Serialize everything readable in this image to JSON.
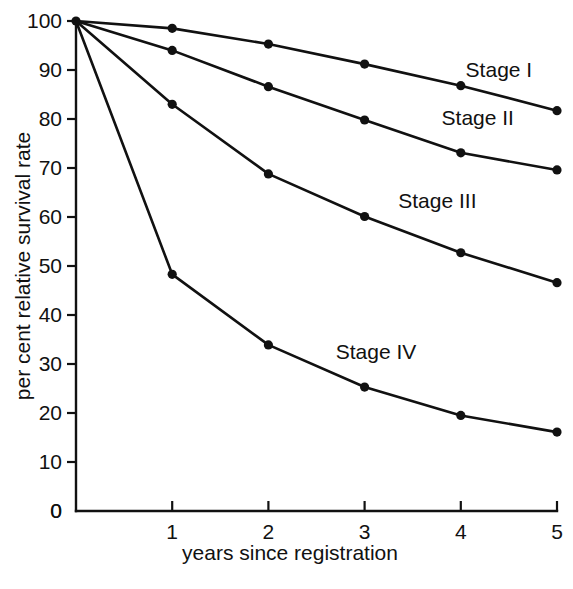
{
  "chart_data": {
    "type": "line",
    "title": "",
    "subtitle": "",
    "xlabel": "years since registration",
    "ylabel": "per cent relative survival rate",
    "xlim": [
      0,
      5
    ],
    "ylim": [
      0,
      100
    ],
    "xticks": [
      0,
      1,
      2,
      3,
      4,
      5
    ],
    "xtick_labels": [
      "0",
      "1",
      "2",
      "3",
      "4",
      "5"
    ],
    "yticks": [
      0,
      10,
      20,
      30,
      40,
      50,
      60,
      70,
      80,
      90,
      100
    ],
    "ytick_labels": [
      "0",
      "10",
      "20",
      "30",
      "40",
      "50",
      "60",
      "70",
      "80",
      "90",
      "100"
    ],
    "grid": false,
    "legend_position": "inline-right-of-series",
    "x": [
      0,
      1,
      2,
      3,
      4,
      5
    ],
    "series": [
      {
        "name": "Stage I",
        "values": [
          100,
          98.5,
          95.3,
          91.2,
          86.8,
          81.7
        ],
        "label_x": 4.05,
        "label_y": 88.5,
        "color": "#111111"
      },
      {
        "name": "Stage II",
        "values": [
          100,
          94.0,
          86.6,
          79.8,
          73.1,
          69.6
        ],
        "label_x": 3.8,
        "label_y": 78.8,
        "color": "#111111"
      },
      {
        "name": "Stage III",
        "values": [
          100,
          83.0,
          68.8,
          60.1,
          52.7,
          46.6
        ],
        "label_x": 3.35,
        "label_y": 61.8,
        "color": "#111111"
      },
      {
        "name": "Stage IV",
        "values": [
          100,
          48.3,
          33.9,
          25.3,
          19.5,
          16.1
        ],
        "label_x": 2.7,
        "label_y": 31.0,
        "color": "#111111"
      }
    ]
  },
  "axes": {
    "x_axis_label": "years since registration",
    "y_axis_label": "per cent relative survival rate"
  }
}
